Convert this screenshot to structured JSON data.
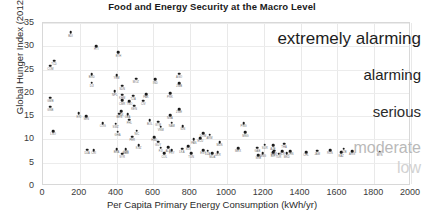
{
  "chart_data": {
    "type": "scatter",
    "title": "Food and Energy Security at the Macro Level",
    "xlabel": "Per Capita Primary Energy Consumption (kWh/yr)",
    "ylabel": "Global Hunger Index (2012)",
    "xlim": [
      0,
      2000
    ],
    "ylim": [
      0,
      35
    ],
    "xticks": [
      0,
      200,
      400,
      600,
      800,
      1000,
      1200,
      1400,
      1600,
      1800,
      2000
    ],
    "yticks": [
      0,
      5,
      10,
      15,
      20,
      25,
      30,
      35
    ],
    "grid": true,
    "legend": "none",
    "annotations": [
      {
        "text": "extremely alarming",
        "position": "right",
        "ghi_band": [
          30,
          35
        ],
        "color": "#1d1d1d"
      },
      {
        "text": "alarming",
        "position": "right",
        "ghi_band": [
          20,
          30
        ],
        "color": "#1d1d1d"
      },
      {
        "text": "serious",
        "position": "right",
        "ghi_band": [
          10,
          20
        ],
        "color": "#2b2b2b"
      },
      {
        "text": "moderate",
        "position": "right",
        "ghi_band": [
          5,
          10
        ],
        "color": "#b9b9b9"
      },
      {
        "text": "low",
        "position": "right",
        "ghi_band": [
          0,
          5
        ],
        "color": "#d2d2d2"
      }
    ],
    "points": [
      {
        "label": "BDI",
        "x": 150,
        "y": 33.0
      },
      {
        "label": "HTI",
        "x": 290,
        "y": 30.0
      },
      {
        "label": "ETH",
        "x": 410,
        "y": 28.7
      },
      {
        "label": "TCD",
        "x": 60,
        "y": 26.9
      },
      {
        "label": "COM",
        "x": 40,
        "y": 25.8
      },
      {
        "label": "BGD",
        "x": 265,
        "y": 24.0
      },
      {
        "label": "MOZ",
        "x": 505,
        "y": 23.0
      },
      {
        "label": "YEM",
        "x": 400,
        "y": 23.8
      },
      {
        "label": "AGO",
        "x": 740,
        "y": 24.1
      },
      {
        "label": "DJI",
        "x": 265,
        "y": 22.2
      },
      {
        "label": "ZMB",
        "x": 740,
        "y": 22.1
      },
      {
        "label": "IND",
        "x": 610,
        "y": 22.9
      },
      {
        "label": "SDN",
        "x": 430,
        "y": 21.5
      },
      {
        "label": "NPL",
        "x": 390,
        "y": 20.3
      },
      {
        "label": "GMB",
        "x": 40,
        "y": 19.0
      },
      {
        "label": "KHM",
        "x": 430,
        "y": 19.6
      },
      {
        "label": "TZA",
        "x": 490,
        "y": 19.4
      },
      {
        "label": "PAK",
        "x": 560,
        "y": 19.7
      },
      {
        "label": "PRK",
        "x": 690,
        "y": 19.9
      },
      {
        "label": "GNB",
        "x": 40,
        "y": 17.0
      },
      {
        "label": "CMR",
        "x": 430,
        "y": 18.4
      },
      {
        "label": "TGO",
        "x": 470,
        "y": 18.2
      },
      {
        "label": "CIV",
        "x": 545,
        "y": 18.3
      },
      {
        "label": "ERI",
        "x": 195,
        "y": 15.6
      },
      {
        "label": "KEN",
        "x": 495,
        "y": 17.2
      },
      {
        "label": "TJK",
        "x": 425,
        "y": 16.0
      },
      {
        "label": "ZWE",
        "x": 740,
        "y": 16.5
      },
      {
        "label": "BEN",
        "x": 415,
        "y": 15.5
      },
      {
        "label": "LBA",
        "x": 460,
        "y": 15.4
      },
      {
        "label": "SEN",
        "x": 235,
        "y": 15.0
      },
      {
        "label": "NGA",
        "x": 690,
        "y": 15.2
      },
      {
        "label": "BOL",
        "x": 580,
        "y": 14.1
      },
      {
        "label": "PHL",
        "x": 470,
        "y": 14.2
      },
      {
        "label": "NAM",
        "x": 700,
        "y": 13.6
      },
      {
        "label": "GTM",
        "x": 625,
        "y": 13.8
      },
      {
        "label": "COG",
        "x": 325,
        "y": 13.5
      },
      {
        "label": "SWZ",
        "x": 395,
        "y": 13.4
      },
      {
        "label": "LSO",
        "x": 55,
        "y": 11.8
      },
      {
        "label": "VNM",
        "x": 640,
        "y": 12.7
      },
      {
        "label": "IDN",
        "x": 760,
        "y": 12.9
      },
      {
        "label": "GHA",
        "x": 405,
        "y": 11.7
      },
      {
        "label": "NIC",
        "x": 510,
        "y": 11.9
      },
      {
        "label": "DOM",
        "x": 870,
        "y": 11.4
      },
      {
        "label": "ARM",
        "x": 905,
        "y": 11.0
      },
      {
        "label": "PNG",
        "x": 1090,
        "y": 13.5
      },
      {
        "label": "MNG",
        "x": 1100,
        "y": 11.5
      },
      {
        "label": "PER",
        "x": 485,
        "y": 10.6
      },
      {
        "label": "HND",
        "x": 605,
        "y": 10.5
      },
      {
        "label": "ECU",
        "x": 855,
        "y": 10.3
      },
      {
        "label": "PAN",
        "x": 820,
        "y": 10.0
      },
      {
        "label": "GUY",
        "x": 625,
        "y": 9.5
      },
      {
        "label": "KGZ",
        "x": 520,
        "y": 8.8
      },
      {
        "label": "MUS",
        "x": 960,
        "y": 9.4
      },
      {
        "label": "NAM2",
        "x": 450,
        "y": 7.8
      },
      {
        "label": "SLV",
        "x": 790,
        "y": 8.6
      },
      {
        "label": "SUR",
        "x": 1205,
        "y": 8.9
      },
      {
        "label": "AZE",
        "x": 1250,
        "y": 8.7
      },
      {
        "label": "THA",
        "x": 1310,
        "y": 9.1
      },
      {
        "label": "GAB",
        "x": 1165,
        "y": 8.2
      },
      {
        "label": "UZB",
        "x": 1635,
        "y": 8.0
      },
      {
        "label": "MAR",
        "x": 1255,
        "y": 7.6
      },
      {
        "label": "BLR",
        "x": 1300,
        "y": 7.5
      },
      {
        "label": "CHN",
        "x": 1345,
        "y": 7.5
      },
      {
        "label": "MKD",
        "x": 1325,
        "y": 7.0
      },
      {
        "label": "TUR",
        "x": 1280,
        "y": 6.9
      },
      {
        "label": "BIH",
        "x": 1250,
        "y": 7.2
      },
      {
        "label": "MNG2",
        "x": 1195,
        "y": 7.1
      },
      {
        "label": "SRB",
        "x": 1170,
        "y": 6.6
      },
      {
        "label": "FJI",
        "x": 640,
        "y": 8.2
      },
      {
        "label": "ALB",
        "x": 680,
        "y": 8.3
      },
      {
        "label": "PRY",
        "x": 700,
        "y": 7.7
      },
      {
        "label": "COL",
        "x": 660,
        "y": 7.0
      },
      {
        "label": "LKA",
        "x": 755,
        "y": 8.0
      },
      {
        "label": "TUN",
        "x": 805,
        "y": 7.0
      },
      {
        "label": "EGY",
        "x": 870,
        "y": 7.7
      },
      {
        "label": "DZA",
        "x": 895,
        "y": 7.6
      },
      {
        "label": "MDA",
        "x": 920,
        "y": 7.0
      },
      {
        "label": "UKR",
        "x": 950,
        "y": 7.3
      },
      {
        "label": "DZA2",
        "x": 240,
        "y": 7.8
      },
      {
        "label": "CRI",
        "x": 275,
        "y": 7.7
      },
      {
        "label": "BRA",
        "x": 400,
        "y": 7.9
      },
      {
        "label": "JOR",
        "x": 450,
        "y": 8.0
      },
      {
        "label": "SYR",
        "x": 430,
        "y": 6.9
      },
      {
        "label": "MEX",
        "x": 1060,
        "y": 8.1
      },
      {
        "label": "CHL",
        "x": 1430,
        "y": 7.3
      },
      {
        "label": "JAM",
        "x": 1490,
        "y": 7.6
      },
      {
        "label": "RUS",
        "x": 1560,
        "y": 7.7
      },
      {
        "label": "KAZ",
        "x": 1620,
        "y": 7.2
      },
      {
        "label": "ARG",
        "x": 1680,
        "y": 7.5
      },
      {
        "label": "MYS",
        "x": 1830,
        "y": 7.4
      }
    ]
  }
}
